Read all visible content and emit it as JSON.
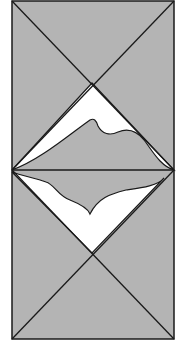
{
  "diagram": {
    "type": "geometric-fold-diagram",
    "colors": {
      "fill": "#b4b4b4",
      "stroke": "#1a1a1a",
      "fold_region": "#ffffff",
      "background": "#ffffff"
    },
    "frame": {
      "x": 12,
      "y": 1,
      "width": 162,
      "height": 338
    },
    "midline_y": 170,
    "top_square": {
      "center": [
        92,
        83
      ]
    },
    "bottom_square": {
      "center": [
        92,
        253
      ]
    },
    "top_fold_path": "M12,170 L92,83 L174,170 C160,166 152,150 144,140 C136,130 128,128 118,132 C110,136 102,134 98,126 C96,120 94,118 90,120 C70,134 40,160 12,170 Z",
    "bottom_fold_path": "M12,172 L92,253 L164,178 C158,186 140,188 126,190 C110,194 98,198 90,214 C88,208 80,204 70,200 C58,196 54,184 46,182 C36,178 22,176 12,172 Z"
  }
}
